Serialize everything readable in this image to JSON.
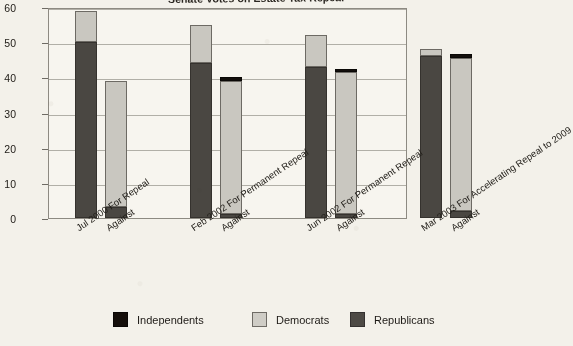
{
  "chart_data": {
    "type": "bar",
    "stacked": true,
    "title": "Senate Votes on Estate Tax Repeal",
    "xlabel": "",
    "ylabel": "",
    "ylim": [
      0,
      60
    ],
    "yticks": [
      0,
      10,
      20,
      30,
      40,
      50,
      60
    ],
    "grid": true,
    "legend_position": "bottom",
    "categories": [
      "Jul 2000 For Repeal",
      "Against",
      "Feb 2002 For Permanent Repeal",
      "Against",
      "Jun 2002 For Permanent Repeal",
      "Against",
      "Mar 2003 For Accelerating Repeal to 2009",
      "Against"
    ],
    "series": [
      {
        "name": "Republicans",
        "color": "#4a4742",
        "values": [
          50,
          3,
          44,
          1,
          43,
          1,
          46,
          2
        ]
      },
      {
        "name": "Democrats",
        "color": "#c9c7c0",
        "values": [
          9,
          36,
          11,
          38,
          9,
          40.5,
          2,
          43.5
        ]
      },
      {
        "name": "Independents",
        "color": "#130f0c",
        "values": [
          0,
          0,
          0,
          1,
          0,
          1,
          0,
          1
        ]
      }
    ],
    "totals": [
      59,
      39,
      55,
      40,
      52,
      42.5,
      48,
      46.5
    ]
  },
  "axis": {
    "y_tick_labels": [
      "60",
      "50",
      "40",
      "30",
      "20",
      "10",
      "0"
    ]
  },
  "legend": {
    "items": [
      {
        "label": "Independents",
        "swatch": "legend-swatch-independents"
      },
      {
        "label": "Democrats",
        "swatch": "legend-swatch-democrats"
      },
      {
        "label": "Republicans",
        "swatch": "legend-swatch-republicans"
      }
    ]
  }
}
